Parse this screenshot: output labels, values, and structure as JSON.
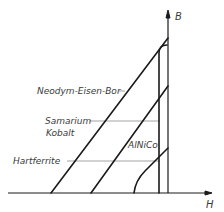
{
  "diagram": {
    "type": "demagnetization-curves",
    "axes": {
      "x_label": "H",
      "y_label": "B"
    },
    "curves": [
      {
        "name": "Neodym-Eisen-Bor",
        "label": "Neodym-Eisen-Bor"
      },
      {
        "name": "Samarium-Kobalt",
        "label_line1": "Samarium",
        "label_line2": "Kobalt"
      },
      {
        "name": "AlNiCo",
        "label": "AlNiCo"
      },
      {
        "name": "Hartferrite",
        "label": "Hartferrite"
      }
    ],
    "colors": {
      "line": "#1a1a1a",
      "leader": "#555555",
      "text": "#3a3a3a",
      "background": "#ffffff"
    }
  }
}
